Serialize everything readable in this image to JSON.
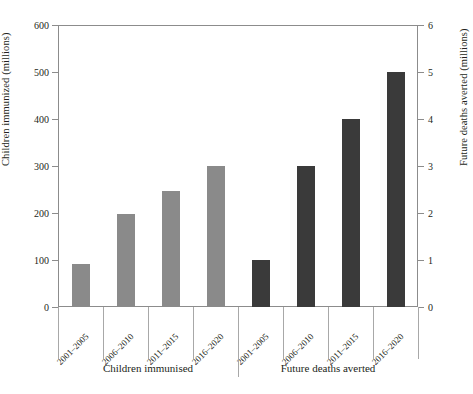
{
  "chart_data": {
    "type": "bar",
    "title": "",
    "xlabel": "",
    "ylabel": "Children immunized (millions)",
    "y2label": "Future deaths averted  (millions)",
    "ylim": [
      0,
      600
    ],
    "y2lim": [
      0,
      6
    ],
    "yticks": [
      0,
      100,
      200,
      300,
      400,
      500,
      600
    ],
    "y2ticks": [
      0,
      1,
      2,
      3,
      4,
      5,
      6
    ],
    "grid": false,
    "legend": "none",
    "categories": [
      "2001–2005",
      "2006–2010",
      "2011–2015",
      "2016–2020"
    ],
    "groups": [
      {
        "name": "Children immunised",
        "axis": "left",
        "units": "millions",
        "color": "#8a8a8a",
        "categories": [
          "2001–2005",
          "2006–2010",
          "2011–2015",
          "2016–2020"
        ],
        "values": [
          91,
          198,
          247,
          300
        ]
      },
      {
        "name": "Future deaths averted",
        "axis": "right",
        "units": "millions",
        "color": "#3a3a3a",
        "categories": [
          "2001–2005",
          "2006–2010",
          "2011–2015",
          "2016–2020"
        ],
        "values": [
          1.0,
          3.0,
          4.0,
          5.0
        ]
      }
    ]
  },
  "axes": {
    "left_title": "Children immunized (millions)",
    "right_title": "Future deaths averted  (millions)",
    "left_ticks": [
      "600",
      "500",
      "400",
      "300",
      "200",
      "100",
      "0"
    ],
    "right_ticks": [
      "6",
      "5",
      "4",
      "3",
      "2",
      "1",
      "0"
    ]
  },
  "groups": {
    "left_label": "Children immunised",
    "right_label": "Future deaths averted"
  },
  "categories": {
    "g1": [
      "2001–2005",
      "2006–2010",
      "2011–2015",
      "2016–2020"
    ],
    "g2": [
      "2001–2005",
      "2006–2010",
      "2011–2015",
      "2016–2020"
    ]
  },
  "colors": {
    "bar_light": "#8a8a8a",
    "bar_dark": "#3a3a3a",
    "axis": "#8c8c8c",
    "text": "#231f20",
    "background": "#ffffff"
  }
}
